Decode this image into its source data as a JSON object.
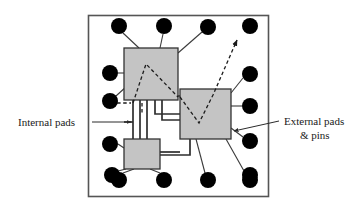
{
  "figure": {
    "type": "diagram",
    "canvas": {
      "width": 358,
      "height": 204,
      "background": "#ffffff"
    },
    "colors": {
      "pad_fill": "#000000",
      "die_fill": "#c4c4c4",
      "die_stroke": "#333333",
      "package_stroke": "#555555",
      "wire_stroke": "#3a3a3a",
      "dashed_stroke": "#2b2b2b",
      "text": "#1a1a1a"
    },
    "package_outline": {
      "x": 88,
      "y": 15,
      "width": 180,
      "height": 181
    },
    "labels": [
      {
        "id": "internal-pads",
        "text": "Internal pads",
        "x": 18,
        "y": 125,
        "anchor": "start",
        "leader": {
          "x1": 92,
          "y1": 122,
          "x2": 131,
          "y2": 122,
          "arrow": "end"
        }
      },
      {
        "id": "external-pads-line1",
        "text": "External pads",
        "x": 284,
        "y": 125,
        "anchor": "start",
        "leader": {
          "x1": 279,
          "y1": 121,
          "x2": 233,
          "y2": 131,
          "arrow": "end"
        }
      },
      {
        "id": "external-pads-line2",
        "text": "& pins",
        "x": 298,
        "y": 139,
        "anchor": "start",
        "leader": null
      }
    ],
    "dies": [
      {
        "id": "die-top-left",
        "x": 124,
        "y": 48,
        "width": 54,
        "height": 52
      },
      {
        "id": "die-right",
        "x": 180,
        "y": 89,
        "width": 51,
        "height": 50
      },
      {
        "id": "die-bottom-left",
        "x": 124,
        "y": 139,
        "width": 36,
        "height": 30
      }
    ],
    "pads": [
      {
        "id": "pad-top-1",
        "cx": 119,
        "cy": 26,
        "r": 8,
        "side": "top"
      },
      {
        "id": "pad-top-2",
        "cx": 164,
        "cy": 26,
        "r": 8,
        "side": "top"
      },
      {
        "id": "pad-top-3",
        "cx": 208,
        "cy": 27,
        "r": 8,
        "side": "top"
      },
      {
        "id": "pad-top-4",
        "cx": 250,
        "cy": 26,
        "r": 8,
        "side": "top"
      },
      {
        "id": "pad-left-1",
        "cx": 110,
        "cy": 73,
        "r": 8,
        "side": "left"
      },
      {
        "id": "pad-left-2",
        "cx": 110,
        "cy": 101,
        "r": 8,
        "side": "left"
      },
      {
        "id": "pad-left-3",
        "cx": 110,
        "cy": 144,
        "r": 8,
        "side": "left"
      },
      {
        "id": "pad-left-4",
        "cx": 112,
        "cy": 175,
        "r": 8,
        "side": "left"
      },
      {
        "id": "pad-right-1",
        "cx": 250,
        "cy": 74,
        "r": 8,
        "side": "right"
      },
      {
        "id": "pad-right-2",
        "cx": 250,
        "cy": 106,
        "r": 8,
        "side": "right"
      },
      {
        "id": "pad-right-3",
        "cx": 250,
        "cy": 141,
        "r": 8,
        "side": "right"
      },
      {
        "id": "pad-right-4",
        "cx": 250,
        "cy": 175,
        "r": 8,
        "side": "right"
      },
      {
        "id": "pad-bottom-1",
        "cx": 119,
        "cy": 180,
        "r": 8,
        "side": "bottom"
      },
      {
        "id": "pad-bottom-2",
        "cx": 164,
        "cy": 180,
        "r": 8,
        "side": "bottom"
      },
      {
        "id": "pad-bottom-3",
        "cx": 208,
        "cy": 180,
        "r": 8,
        "side": "bottom"
      },
      {
        "id": "pad-bottom-4",
        "cx": 250,
        "cy": 180,
        "r": 8,
        "side": "bottom"
      }
    ],
    "bond_wires": [
      {
        "id": "wire-top1-die1",
        "x1": 123,
        "y1": 33,
        "x2": 139,
        "y2": 48
      },
      {
        "id": "wire-top2-die1",
        "x1": 163,
        "y1": 34,
        "x2": 160,
        "y2": 48
      },
      {
        "id": "wire-top3-die1",
        "x1": 202,
        "y1": 32,
        "x2": 178,
        "y2": 53
      },
      {
        "id": "wire-left1-die1",
        "x1": 118,
        "y1": 73,
        "x2": 124,
        "y2": 73
      },
      {
        "id": "wire-left2-die1",
        "x1": 116,
        "y1": 96,
        "x2": 127,
        "y2": 86
      },
      {
        "id": "wire-right1-die2",
        "x1": 243,
        "y1": 78,
        "x2": 231,
        "y2": 93
      },
      {
        "id": "wire-right2-die2",
        "x1": 242,
        "y1": 106,
        "x2": 231,
        "y2": 106
      },
      {
        "id": "wire-right3-die2",
        "x1": 243,
        "y1": 137,
        "x2": 231,
        "y2": 128
      },
      {
        "id": "wire-right4-die2",
        "x1": 244,
        "y1": 171,
        "x2": 226,
        "y2": 139
      },
      {
        "id": "wire-bottom3-die2",
        "x1": 205,
        "y1": 173,
        "x2": 196,
        "y2": 139
      },
      {
        "id": "wire-bottom1-die3",
        "x1": 123,
        "y1": 173,
        "x2": 134,
        "y2": 169
      },
      {
        "id": "wire-bottom2-die3",
        "x1": 160,
        "y1": 173,
        "x2": 150,
        "y2": 169
      },
      {
        "id": "wire-left3-die3",
        "x1": 118,
        "y1": 144,
        "x2": 124,
        "y2": 148
      },
      {
        "id": "wire-left4-die3",
        "x1": 118,
        "y1": 171,
        "x2": 126,
        "y2": 169
      },
      {
        "id": "wire-die3-right",
        "x1": 160,
        "y1": 152,
        "x2": 180,
        "y2": 152
      }
    ],
    "bus_traces": [
      {
        "id": "bus-1",
        "points": "133,100 133,139"
      },
      {
        "id": "bus-2",
        "points": "140,100 140,139"
      },
      {
        "id": "bus-3",
        "points": "147,100 147,139"
      },
      {
        "id": "bus-4",
        "points": "155,100 155,114 180,114"
      },
      {
        "id": "bus-5",
        "points": "162,100 162,120 180,120"
      },
      {
        "id": "bus-6",
        "points": "169,100 169,96 180,96"
      },
      {
        "id": "bus-7",
        "points": "160,155 190,155 190,139"
      },
      {
        "id": "bus-8",
        "points": "124,122 133,122"
      }
    ],
    "dashed_nets": [
      {
        "id": "dashed-die1-fanout",
        "points": "133,103 146,64 178,97",
        "arrow": false
      },
      {
        "id": "dashed-die2-v",
        "points": "180,97 199,123 213,95 237,40",
        "arrow": true,
        "arrow_at": "237,40"
      },
      {
        "id": "dashed-left-stub",
        "points": "111,103 131,103",
        "arrow": false
      },
      {
        "id": "dashed-vertical-stub",
        "points": "142,103 142,112",
        "arrow": false
      }
    ]
  }
}
